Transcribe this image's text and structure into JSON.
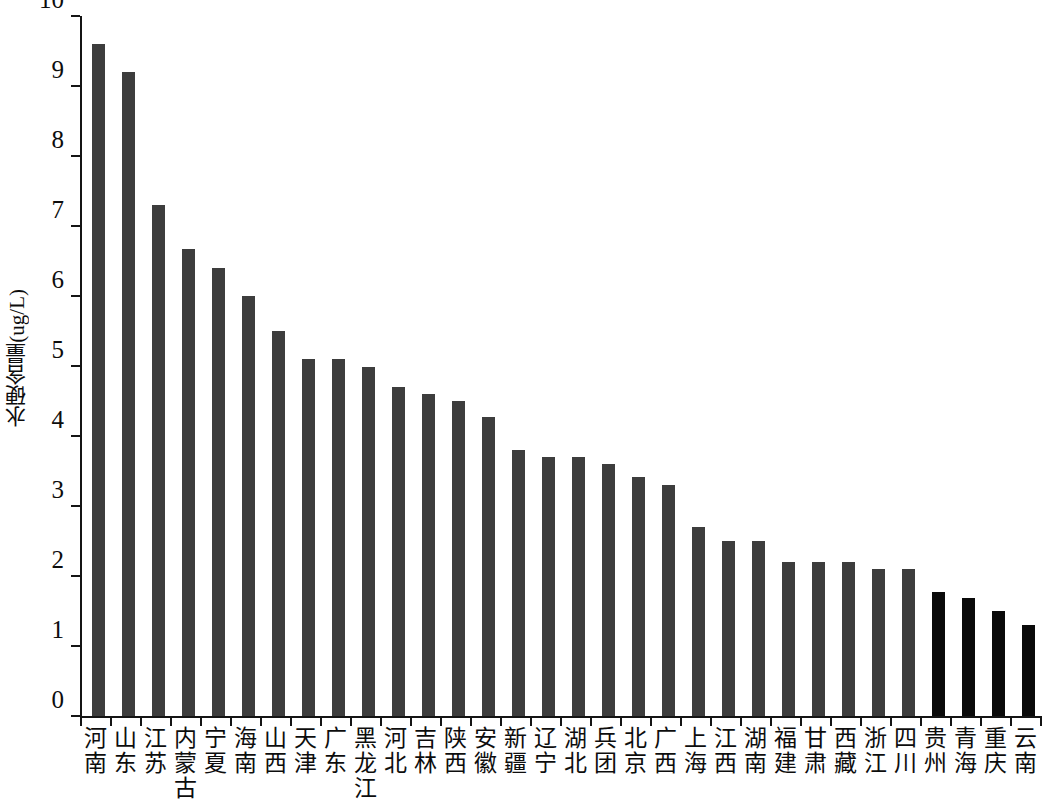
{
  "chart_data": {
    "type": "bar",
    "title": "",
    "subtitle": "",
    "xlabel": "",
    "ylabel": "水硬含量(ug/L)",
    "ylim": [
      0,
      10
    ],
    "ytick_labels": [
      "10",
      "9",
      "8",
      "7",
      "6",
      "5",
      "4",
      "3",
      "2",
      "1",
      "0"
    ],
    "ytick_values": [
      10,
      9,
      8,
      7,
      6,
      5,
      4,
      3,
      2,
      1,
      0
    ],
    "grid": false,
    "legend": null,
    "bar_color_default": "#3d3d3d",
    "bar_color_highlight": "#0a0a0a",
    "highlight_categories": [
      "贵州",
      "青海",
      "重庆",
      "云南"
    ],
    "categories": [
      "河南",
      "山东",
      "江苏",
      "内蒙古",
      "宁夏",
      "海南",
      "山西",
      "天津",
      "广东",
      "黑龙江",
      "河北",
      "吉林",
      "陕西",
      "安徽",
      "新疆",
      "辽宁",
      "湖北",
      "兵团",
      "北京",
      "广西",
      "上海",
      "江西",
      "湖南",
      "福建",
      "甘肃",
      "西藏",
      "浙江",
      "四川",
      "贵州",
      "青海",
      "重庆",
      "云南"
    ],
    "values": [
      9.6,
      9.2,
      7.3,
      6.67,
      6.4,
      6.0,
      5.5,
      5.1,
      5.1,
      4.98,
      4.7,
      4.6,
      4.5,
      4.27,
      3.8,
      3.7,
      3.7,
      3.6,
      3.42,
      3.3,
      2.7,
      2.5,
      2.5,
      2.2,
      2.2,
      2.2,
      2.1,
      2.1,
      1.77,
      1.68,
      1.5,
      1.3
    ]
  }
}
